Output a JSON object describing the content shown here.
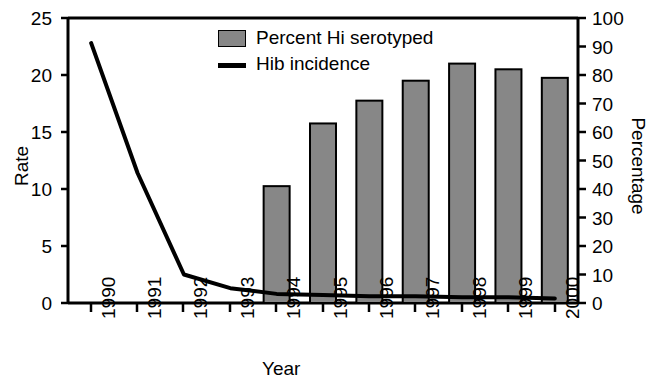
{
  "chart_data": {
    "type": "bar",
    "title": "",
    "subtitle": "",
    "xlabel": "Year",
    "ylabel": "Rate",
    "y2label": "Percentage",
    "categories": [
      "1990",
      "1991",
      "1992",
      "1993",
      "1994",
      "1995",
      "1996",
      "1997",
      "1998",
      "1999",
      "2000"
    ],
    "ylim": [
      0,
      25
    ],
    "yticks": [
      0,
      5,
      10,
      15,
      20,
      25
    ],
    "y2lim": [
      0,
      100
    ],
    "y2ticks": [
      0,
      10,
      20,
      30,
      40,
      50,
      60,
      70,
      80,
      90,
      100
    ],
    "grid": false,
    "legend_position": "top-center",
    "series": [
      {
        "name": "Percent Hi serotyped",
        "type": "bar",
        "axis": "right",
        "unit": "%",
        "color": "#878787",
        "edge_color": "#000000",
        "values": [
          null,
          null,
          null,
          null,
          41,
          63,
          71,
          78,
          84,
          82,
          79
        ]
      },
      {
        "name": "Hib incidence",
        "type": "line",
        "axis": "left",
        "color": "#000000",
        "values": [
          22.8,
          11.4,
          2.5,
          1.3,
          0.8,
          0.7,
          0.6,
          0.6,
          0.5,
          0.5,
          0.4
        ]
      }
    ]
  },
  "legend": {
    "items": [
      {
        "label": "Percent Hi serotyped",
        "marker": "square-swatch"
      },
      {
        "label": "Hib incidence",
        "marker": "line-swatch"
      }
    ]
  },
  "axes": {
    "left": {
      "title": "Rate",
      "ticks": [
        "25",
        "20",
        "15",
        "10",
        "5",
        "0"
      ]
    },
    "right": {
      "title": "Percentage",
      "ticks": [
        "100",
        "90",
        "80",
        "70",
        "60",
        "50",
        "40",
        "30",
        "20",
        "10",
        "0"
      ]
    },
    "bottom": {
      "title": "Year",
      "ticks": [
        "1990",
        "1991",
        "1992",
        "1993",
        "1994",
        "1995",
        "1996",
        "1997",
        "1998",
        "1999",
        "2000"
      ]
    }
  },
  "colors": {
    "bar_fill": "#878787",
    "bar_edge": "#000000",
    "line": "#000000",
    "axis": "#000000",
    "background": "#ffffff"
  }
}
